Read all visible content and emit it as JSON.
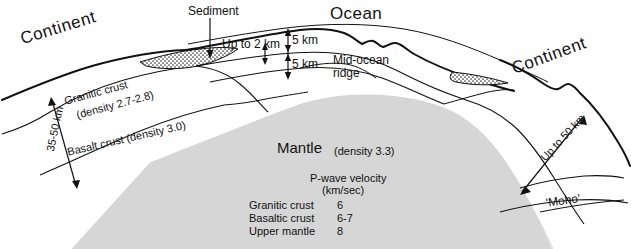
{
  "diagram": {
    "colors": {
      "mantle_fill": "#d6d6d6",
      "line": "#111111",
      "sediment_stipple": "#3a3a3a",
      "background": "#ffffff"
    },
    "labels": {
      "continent_left": "Continent",
      "continent_right": "Continent",
      "ocean": "Ocean",
      "sediment": "Sediment",
      "up_to_2km": "Up to 2 km",
      "five_km_upper": "5 km",
      "five_km_lower": "5 km",
      "mid_ocean_ridge_line1": "Mid-ocean",
      "mid_ocean_ridge_line2": "ridge",
      "granitic_crust_line1": "Granitic crust",
      "granitic_crust_line2": "(density 2.7-2.8)",
      "basalt_crust": "Basalt crust (density 3.0)",
      "crust_thickness": "35-50 km",
      "up_to_50km": "Up to 50 km",
      "moho": "'Moho'",
      "mantle": "Mantle",
      "mantle_density": "(density 3.3)"
    },
    "pwave": {
      "heading_line1": "P-wave velocity",
      "heading_line2": "(km/sec)",
      "rows": [
        {
          "layer": "Granitic crust",
          "velocity": "6"
        },
        {
          "layer": "Basaltic crust",
          "velocity": "6-7"
        },
        {
          "layer": "Upper mantle",
          "velocity": "8"
        }
      ]
    }
  }
}
